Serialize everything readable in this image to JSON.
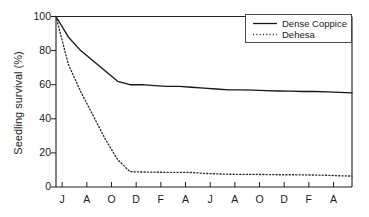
{
  "chart_data": {
    "type": "line",
    "title": "",
    "xlabel": "",
    "ylabel": "Seedling survival (%)",
    "ylim": [
      0,
      100
    ],
    "yticks": [
      0,
      20,
      40,
      60,
      80,
      100
    ],
    "ytick_labels": [
      "0",
      "20",
      "40",
      "60",
      "80",
      "100"
    ],
    "xlim": [
      0,
      24
    ],
    "x": [
      0,
      1,
      2,
      3,
      4,
      5,
      6,
      7,
      8,
      9,
      10,
      11,
      12,
      13,
      14,
      15,
      16,
      17,
      18,
      19,
      20,
      21,
      22,
      23,
      24
    ],
    "xtick_positions": [
      0.5,
      2.5,
      4.5,
      6.5,
      8.5,
      10.5,
      12.5,
      14.5,
      16.5,
      18.5,
      20.5,
      22.5
    ],
    "xtick_labels": [
      "J",
      "A",
      "O",
      "D",
      "F",
      "A",
      "J",
      "A",
      "O",
      "D",
      "F",
      "A"
    ],
    "grid": false,
    "legend_position": "upper right",
    "series": [
      {
        "name": "Dense Coppice",
        "style": "solid",
        "color": "#17171a",
        "values": [
          100,
          88,
          80,
          74,
          68,
          62,
          60,
          60,
          59.5,
          59,
          59,
          58.5,
          58,
          57.5,
          57,
          57,
          56.8,
          56.5,
          56.3,
          56.2,
          56,
          56,
          55.8,
          55.5,
          55.2
        ]
      },
      {
        "name": "Dehesa",
        "style": "dotted",
        "color": "#2a2a2e",
        "values": [
          100,
          72,
          56,
          42,
          28,
          16,
          9,
          8.8,
          8.7,
          8.6,
          8.6,
          8.5,
          8.0,
          7.7,
          7.5,
          7.4,
          7.4,
          7.3,
          7.2,
          7.2,
          7.1,
          7.0,
          6.9,
          6.6,
          6.4
        ]
      }
    ]
  },
  "legend": {
    "entries": [
      {
        "label": "Dense Coppice"
      },
      {
        "label": "Dehesa"
      }
    ]
  }
}
